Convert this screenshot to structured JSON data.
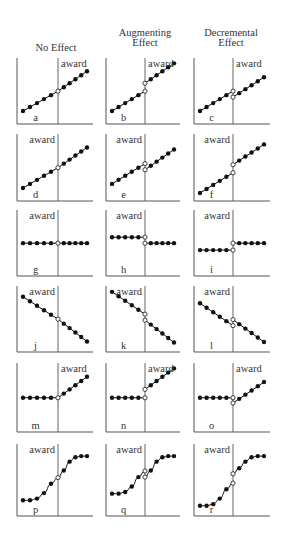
{
  "figure": {
    "columns": [
      {
        "id": "no-effect",
        "title_lines": [
          "",
          "No Effect"
        ]
      },
      {
        "id": "augmenting-effect",
        "title_lines": [
          "Augmenting",
          "Effect"
        ]
      },
      {
        "id": "decremental-effect",
        "title_lines": [
          "Decremental",
          "Effect"
        ]
      }
    ],
    "marker_label": "award",
    "colors": {
      "line": "#111111",
      "axis": "#555555",
      "open_marker_fill": "#ffffff"
    },
    "panels": [
      {
        "letter": "a",
        "row": 0,
        "col": 0,
        "label_side": "right",
        "pre": [
          [
            0,
            0.1
          ],
          [
            1,
            0.18
          ],
          [
            2,
            0.26
          ],
          [
            3,
            0.34
          ],
          [
            4,
            0.42
          ],
          [
            5,
            0.5
          ]
        ],
        "post": [
          [
            5,
            0.5
          ],
          [
            6,
            0.58
          ],
          [
            7,
            0.66
          ],
          [
            8,
            0.74
          ],
          [
            9,
            0.82
          ],
          [
            10,
            0.9
          ]
        ]
      },
      {
        "letter": "b",
        "row": 0,
        "col": 1,
        "label_side": "right",
        "pre": [
          [
            0,
            0.1
          ],
          [
            1,
            0.18
          ],
          [
            2,
            0.26
          ],
          [
            3,
            0.34
          ],
          [
            4,
            0.42
          ],
          [
            5,
            0.5
          ]
        ],
        "post": [
          [
            5,
            0.66
          ],
          [
            6,
            0.74
          ],
          [
            7,
            0.82
          ],
          [
            8,
            0.9
          ],
          [
            9,
            0.98
          ],
          [
            10,
            1.06
          ]
        ]
      },
      {
        "letter": "c",
        "row": 0,
        "col": 2,
        "label_side": "right",
        "pre": [
          [
            0,
            0.1
          ],
          [
            1,
            0.18
          ],
          [
            2,
            0.26
          ],
          [
            3,
            0.34
          ],
          [
            4,
            0.42
          ],
          [
            5,
            0.5
          ]
        ],
        "post": [
          [
            5,
            0.38
          ],
          [
            6,
            0.46
          ],
          [
            7,
            0.54
          ],
          [
            8,
            0.62
          ],
          [
            9,
            0.7
          ],
          [
            10,
            0.78
          ]
        ]
      },
      {
        "letter": "d",
        "row": 1,
        "col": 0,
        "label_side": "left",
        "pre": [
          [
            0,
            0.1
          ],
          [
            1,
            0.18
          ],
          [
            2,
            0.26
          ],
          [
            3,
            0.34
          ],
          [
            4,
            0.42
          ],
          [
            5,
            0.5
          ]
        ],
        "post": [
          [
            5,
            0.5
          ],
          [
            6,
            0.58
          ],
          [
            7,
            0.66
          ],
          [
            8,
            0.74
          ],
          [
            9,
            0.82
          ],
          [
            10,
            0.9
          ]
        ]
      },
      {
        "letter": "e",
        "row": 1,
        "col": 1,
        "label_side": "left",
        "pre": [
          [
            0,
            0.18
          ],
          [
            1,
            0.26
          ],
          [
            2,
            0.34
          ],
          [
            3,
            0.42
          ],
          [
            4,
            0.5
          ],
          [
            5,
            0.58
          ]
        ],
        "post": [
          [
            5,
            0.46
          ],
          [
            6,
            0.54
          ],
          [
            7,
            0.62
          ],
          [
            8,
            0.7
          ],
          [
            9,
            0.78
          ],
          [
            10,
            0.86
          ]
        ]
      },
      {
        "letter": "f",
        "row": 1,
        "col": 2,
        "label_side": "left",
        "pre": [
          [
            0,
            0.0
          ],
          [
            1,
            0.08
          ],
          [
            2,
            0.16
          ],
          [
            3,
            0.24
          ],
          [
            4,
            0.32
          ],
          [
            5,
            0.4
          ]
        ],
        "post": [
          [
            5,
            0.56
          ],
          [
            6,
            0.64
          ],
          [
            7,
            0.72
          ],
          [
            8,
            0.8
          ],
          [
            9,
            0.88
          ],
          [
            10,
            0.96
          ]
        ]
      },
      {
        "letter": "g",
        "row": 2,
        "col": 0,
        "label_side": "left",
        "pre": [
          [
            0,
            0.5
          ],
          [
            1,
            0.5
          ],
          [
            2,
            0.5
          ],
          [
            3,
            0.5
          ],
          [
            4,
            0.5
          ],
          [
            5,
            0.5
          ]
        ],
        "post": [
          [
            5,
            0.5
          ],
          [
            6,
            0.5
          ],
          [
            7,
            0.5
          ],
          [
            8,
            0.5
          ],
          [
            9,
            0.5
          ],
          [
            10,
            0.5
          ]
        ]
      },
      {
        "letter": "h",
        "row": 2,
        "col": 1,
        "label_side": "left",
        "pre": [
          [
            0,
            0.62
          ],
          [
            1,
            0.62
          ],
          [
            2,
            0.62
          ],
          [
            3,
            0.62
          ],
          [
            4,
            0.62
          ],
          [
            5,
            0.62
          ]
        ],
        "post": [
          [
            5,
            0.5
          ],
          [
            6,
            0.5
          ],
          [
            7,
            0.5
          ],
          [
            8,
            0.5
          ],
          [
            9,
            0.5
          ],
          [
            10,
            0.5
          ]
        ]
      },
      {
        "letter": "i",
        "row": 2,
        "col": 2,
        "label_side": "left",
        "pre": [
          [
            0,
            0.36
          ],
          [
            1,
            0.36
          ],
          [
            2,
            0.36
          ],
          [
            3,
            0.36
          ],
          [
            4,
            0.36
          ],
          [
            5,
            0.36
          ]
        ],
        "post": [
          [
            5,
            0.5
          ],
          [
            6,
            0.5
          ],
          [
            7,
            0.5
          ],
          [
            8,
            0.5
          ],
          [
            9,
            0.5
          ],
          [
            10,
            0.5
          ]
        ]
      },
      {
        "letter": "j",
        "row": 3,
        "col": 0,
        "label_side": "left",
        "pre": [
          [
            0,
            0.95
          ],
          [
            1,
            0.86
          ],
          [
            2,
            0.77
          ],
          [
            3,
            0.68
          ],
          [
            4,
            0.59
          ],
          [
            5,
            0.5
          ]
        ],
        "post": [
          [
            5,
            0.5
          ],
          [
            6,
            0.41
          ],
          [
            7,
            0.32
          ],
          [
            8,
            0.23
          ],
          [
            9,
            0.14
          ],
          [
            10,
            0.05
          ]
        ]
      },
      {
        "letter": "k",
        "row": 3,
        "col": 1,
        "label_side": "left",
        "pre": [
          [
            0,
            1.05
          ],
          [
            1,
            0.96
          ],
          [
            2,
            0.87
          ],
          [
            3,
            0.78
          ],
          [
            4,
            0.69
          ],
          [
            5,
            0.6
          ]
        ],
        "post": [
          [
            5,
            0.48
          ],
          [
            6,
            0.39
          ],
          [
            7,
            0.3
          ],
          [
            8,
            0.21
          ],
          [
            9,
            0.12
          ],
          [
            10,
            0.03
          ]
        ]
      },
      {
        "letter": "l",
        "row": 3,
        "col": 2,
        "label_side": "left",
        "pre": [
          [
            0,
            0.82
          ],
          [
            1,
            0.73
          ],
          [
            2,
            0.64
          ],
          [
            3,
            0.55
          ],
          [
            4,
            0.46
          ],
          [
            5,
            0.37
          ]
        ],
        "post": [
          [
            5,
            0.49
          ],
          [
            6,
            0.4
          ],
          [
            7,
            0.31
          ],
          [
            8,
            0.22
          ],
          [
            9,
            0.13
          ],
          [
            10,
            0.04
          ]
        ]
      },
      {
        "letter": "m",
        "row": 4,
        "col": 0,
        "label_side": "right",
        "pre": [
          [
            0,
            0.5
          ],
          [
            1,
            0.5
          ],
          [
            2,
            0.5
          ],
          [
            3,
            0.5
          ],
          [
            4,
            0.5
          ],
          [
            5,
            0.5
          ]
        ],
        "post": [
          [
            5,
            0.5
          ],
          [
            6,
            0.58
          ],
          [
            7,
            0.66
          ],
          [
            8,
            0.74
          ],
          [
            9,
            0.82
          ],
          [
            10,
            0.9
          ]
        ]
      },
      {
        "letter": "n",
        "row": 4,
        "col": 1,
        "label_side": "right",
        "pre": [
          [
            0,
            0.5
          ],
          [
            1,
            0.5
          ],
          [
            2,
            0.5
          ],
          [
            3,
            0.5
          ],
          [
            4,
            0.5
          ],
          [
            5,
            0.5
          ]
        ],
        "post": [
          [
            5,
            0.66
          ],
          [
            6,
            0.74
          ],
          [
            7,
            0.82
          ],
          [
            8,
            0.9
          ],
          [
            9,
            0.98
          ],
          [
            10,
            1.06
          ]
        ]
      },
      {
        "letter": "o",
        "row": 4,
        "col": 2,
        "label_side": "right",
        "pre": [
          [
            0,
            0.5
          ],
          [
            1,
            0.5
          ],
          [
            2,
            0.5
          ],
          [
            3,
            0.5
          ],
          [
            4,
            0.5
          ],
          [
            5,
            0.5
          ]
        ],
        "post": [
          [
            5,
            0.4
          ],
          [
            6,
            0.48
          ],
          [
            7,
            0.56
          ],
          [
            8,
            0.64
          ],
          [
            9,
            0.72
          ],
          [
            10,
            0.8
          ]
        ]
      },
      {
        "letter": "p",
        "row": 5,
        "col": 0,
        "label_side": "left",
        "pre": [
          [
            0,
            0.14
          ],
          [
            1,
            0.14
          ],
          [
            2,
            0.17
          ],
          [
            3,
            0.27
          ],
          [
            4,
            0.44
          ],
          [
            5,
            0.55
          ]
        ],
        "post": [
          [
            5,
            0.55
          ],
          [
            6,
            0.68
          ],
          [
            7,
            0.84
          ],
          [
            8,
            0.92
          ],
          [
            9,
            0.94
          ],
          [
            10,
            0.94
          ]
        ]
      },
      {
        "letter": "q",
        "row": 5,
        "col": 1,
        "label_side": "left",
        "pre": [
          [
            0,
            0.26
          ],
          [
            1,
            0.26
          ],
          [
            2,
            0.29
          ],
          [
            3,
            0.39
          ],
          [
            4,
            0.56
          ],
          [
            5,
            0.67
          ]
        ],
        "post": [
          [
            5,
            0.56
          ],
          [
            6,
            0.68
          ],
          [
            7,
            0.84
          ],
          [
            8,
            0.92
          ],
          [
            9,
            0.94
          ],
          [
            10,
            0.94
          ]
        ]
      },
      {
        "letter": "r",
        "row": 5,
        "col": 2,
        "label_side": "left",
        "pre": [
          [
            0,
            0.04
          ],
          [
            1,
            0.04
          ],
          [
            2,
            0.07
          ],
          [
            3,
            0.17
          ],
          [
            4,
            0.34
          ],
          [
            5,
            0.45
          ]
        ],
        "post": [
          [
            5,
            0.62
          ],
          [
            6,
            0.72
          ],
          [
            7,
            0.84
          ],
          [
            8,
            0.92
          ],
          [
            9,
            0.94
          ],
          [
            10,
            0.94
          ]
        ]
      }
    ]
  }
}
